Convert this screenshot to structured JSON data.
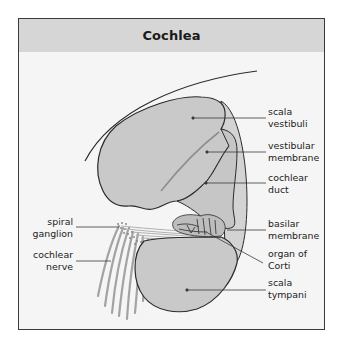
{
  "figure": {
    "title": "Cochlea",
    "colors": {
      "header_bg": "#d6d6d6",
      "panel_bg": "#f5f5f5",
      "tissue_fill": "#c9c9c9",
      "outline": "#2b2b2b",
      "leader": "#3a3a3a",
      "nerve": "#9a9a9a"
    }
  },
  "labels": {
    "right": [
      {
        "line1": "scala",
        "line2": "vestibuli"
      },
      {
        "line1": "vestibular",
        "line2": "membrane"
      },
      {
        "line1": "cochlear",
        "line2": "duct"
      },
      {
        "line1": "basilar",
        "line2": "membrane"
      },
      {
        "line1": "organ of",
        "line2": "Corti"
      },
      {
        "line1": "scala",
        "line2": "tympani"
      }
    ],
    "left": [
      {
        "line1": "spiral",
        "line2": "ganglion"
      },
      {
        "line1": "cochlear",
        "line2": "nerve"
      }
    ]
  }
}
